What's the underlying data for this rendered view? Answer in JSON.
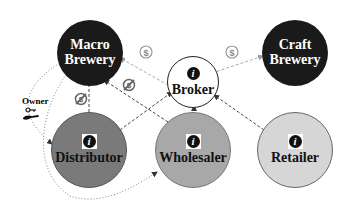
{
  "diagram": {
    "nodes": [
      {
        "id": "macro_brewery",
        "label": "Macro\nBrewery",
        "line1": "Macro",
        "line2": "Brewery",
        "fill": "#1a1a1a",
        "text_color": "#ffffff",
        "info_icon": false
      },
      {
        "id": "craft_brewery",
        "label": "Craft\nBrewery",
        "line1": "Craft",
        "line2": "Brewery",
        "fill": "#1a1a1a",
        "text_color": "#ffffff",
        "info_icon": false
      },
      {
        "id": "broker",
        "label": "Broker",
        "fill": "#ffffff",
        "text_color": "#111111",
        "info_icon": true
      },
      {
        "id": "distributor",
        "label": "Distributor",
        "fill": "#7a7a7a",
        "text_color": "#111111",
        "info_icon": true
      },
      {
        "id": "wholesaler",
        "label": "Wholesaler",
        "fill": "#a8a8a8",
        "text_color": "#111111",
        "info_icon": true
      },
      {
        "id": "retailer",
        "label": "Retailer",
        "fill": "#d6d6d6",
        "text_color": "#111111",
        "info_icon": true
      }
    ],
    "owner": {
      "label": "Owner",
      "icon": "key-hand-icon"
    },
    "edges": [
      {
        "from": "broker",
        "to": "macro_brewery",
        "style": "dashed-light",
        "icon": "dollar-icon"
      },
      {
        "from": "broker",
        "to": "craft_brewery",
        "style": "dashed-light",
        "icon": "dollar-icon"
      },
      {
        "from": "distributor",
        "to": "macro_brewery",
        "style": "dashed",
        "icon": "no-dollar-icon"
      },
      {
        "from": "wholesaler",
        "to": "macro_brewery",
        "style": "dashed",
        "icon": "no-dollar-icon"
      },
      {
        "from": "distributor",
        "to": "broker",
        "style": "dashed"
      },
      {
        "from": "wholesaler",
        "to": "broker",
        "style": "dashed"
      },
      {
        "from": "retailer",
        "to": "broker",
        "style": "dashed"
      },
      {
        "from": "macro_brewery",
        "to": "distributor",
        "style": "dotted",
        "meaning": "owner"
      },
      {
        "from": "macro_brewery",
        "to": "wholesaler",
        "style": "dotted",
        "meaning": "owner"
      }
    ],
    "icon_text": {
      "info": "i",
      "dollar": "$"
    }
  }
}
